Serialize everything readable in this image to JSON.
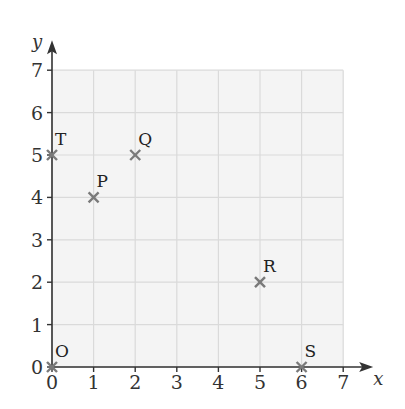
{
  "chart_data": {
    "type": "scatter",
    "title": "",
    "xlabel": "x",
    "ylabel": "y",
    "xlim": [
      0,
      7
    ],
    "ylim": [
      0,
      7
    ],
    "grid": true,
    "x_ticks": [
      "0",
      "1",
      "2",
      "3",
      "4",
      "5",
      "6",
      "7"
    ],
    "y_ticks": [
      "0",
      "1",
      "2",
      "3",
      "4",
      "5",
      "6",
      "7"
    ],
    "points": [
      {
        "label": "O",
        "x": 0,
        "y": 0
      },
      {
        "label": "P",
        "x": 1,
        "y": 4
      },
      {
        "label": "Q",
        "x": 2,
        "y": 5
      },
      {
        "label": "R",
        "x": 5,
        "y": 2
      },
      {
        "label": "S",
        "x": 6,
        "y": 0
      },
      {
        "label": "T",
        "x": 0,
        "y": 5
      }
    ],
    "marker": "x",
    "colors": {
      "grid_bg": "#f4f4f4",
      "grid_line": "#dadada",
      "axis": "#333333",
      "marker": "#7a7a7a"
    }
  }
}
